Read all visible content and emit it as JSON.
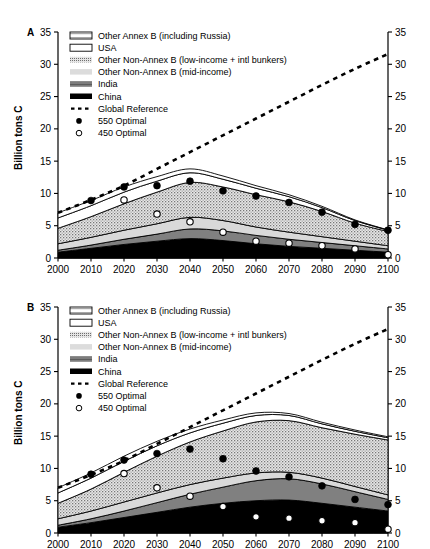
{
  "figure": {
    "panels": [
      {
        "letter": "A",
        "ylabel": "Billion tons C",
        "legend": [
          {
            "label": "Other Annex B (including Russia)",
            "swatch": "annexb-swatch"
          },
          {
            "label": "USA",
            "swatch": "usa-swatch"
          },
          {
            "label": "Other Non-Annex B (low-income + intl bunkers)",
            "swatch": "lowincome-swatch"
          },
          {
            "label": "Other Non-Annex B (mid-income)",
            "swatch": "midincome-swatch"
          },
          {
            "label": "India",
            "swatch": "india-swatch"
          },
          {
            "label": "China",
            "swatch": "china-swatch"
          },
          {
            "label": "Global Reference",
            "swatch": "dashed-line-swatch"
          },
          {
            "label": "550 Optimal",
            "swatch": "filled-circle-swatch"
          },
          {
            "label": "450 Optimal",
            "swatch": "open-circle-swatch"
          }
        ]
      },
      {
        "letter": "B",
        "ylabel": "Billion tons C",
        "legend": [
          {
            "label": "Other Annex B (including Russia)",
            "swatch": "annexb-swatch"
          },
          {
            "label": "USA",
            "swatch": "usa-swatch"
          },
          {
            "label": "Other Non-Annex B (low-income + intl bunkers)",
            "swatch": "lowincome-swatch"
          },
          {
            "label": "Other Non-Annex B (mid-income)",
            "swatch": "midincome-swatch"
          },
          {
            "label": "India",
            "swatch": "india-swatch"
          },
          {
            "label": "China",
            "swatch": "china-swatch"
          },
          {
            "label": "Global Reference",
            "swatch": "dashed-line-swatch"
          },
          {
            "label": "550 Optimal",
            "swatch": "filled-circle-swatch"
          },
          {
            "label": "450 Optimal",
            "swatch": "open-circle-swatch"
          }
        ]
      }
    ]
  },
  "colors": {
    "china": "#000000",
    "india": "#808080",
    "midincome": "#d9d9d9",
    "lowincome": "#b5b5b5",
    "usa": "#ffffff",
    "annexb": "#ffffff",
    "reference": "#000000",
    "axis": "#000000"
  },
  "chart_data": [
    {
      "type": "area",
      "title": "A",
      "panel": "A",
      "xlabel": "",
      "ylabel": "Billion tons C",
      "xlim": [
        2000,
        2100
      ],
      "ylim": [
        0,
        35
      ],
      "yticks": [
        0,
        5,
        10,
        15,
        20,
        25,
        30,
        35
      ],
      "grid": false,
      "legend_position": "top-left",
      "dual_y_axis": true,
      "x": [
        2000,
        2010,
        2020,
        2030,
        2040,
        2050,
        2060,
        2070,
        2080,
        2090,
        2100
      ],
      "categories": [
        "2000",
        "2010",
        "2020",
        "2030",
        "2040",
        "2050",
        "2060",
        "2070",
        "2080",
        "2090",
        "2100"
      ],
      "stack_order": [
        "China",
        "India",
        "Other Non-Annex B (mid-income)",
        "Other Non-Annex B (low-income + intl bunkers)",
        "USA",
        "Other Annex B (including Russia)"
      ],
      "series": [
        {
          "name": "China",
          "values": [
            0.9,
            1.5,
            2.1,
            2.6,
            3.0,
            2.7,
            2.2,
            1.8,
            1.5,
            1.2,
            0.9
          ]
        },
        {
          "name": "India",
          "values": [
            0.3,
            0.5,
            0.8,
            1.1,
            1.5,
            1.5,
            1.3,
            1.1,
            0.9,
            0.7,
            0.5
          ]
        },
        {
          "name": "Other Non-Annex B (mid-income)",
          "values": [
            1.0,
            1.2,
            1.4,
            1.6,
            1.8,
            1.6,
            1.3,
            1.1,
            0.9,
            0.7,
            0.5
          ]
        },
        {
          "name": "Other Non-Annex B (low-income + intl bunkers)",
          "values": [
            2.4,
            3.2,
            4.1,
            4.9,
            5.4,
            5.2,
            5.0,
            4.7,
            3.9,
            2.8,
            2.2
          ]
        },
        {
          "name": "USA",
          "values": [
            1.6,
            1.7,
            1.8,
            1.7,
            1.5,
            1.2,
            1.0,
            0.8,
            0.6,
            0.4,
            0.2
          ]
        },
        {
          "name": "Other Annex B (including Russia)",
          "values": [
            0.8,
            0.8,
            0.8,
            0.7,
            0.6,
            0.5,
            0.4,
            0.3,
            0.2,
            0.1,
            0.05
          ]
        }
      ],
      "stack_totals": [
        7.0,
        8.9,
        11.0,
        12.6,
        13.8,
        12.7,
        11.2,
        9.8,
        8.0,
        5.9,
        4.35
      ],
      "global_reference": {
        "name": "Global Reference",
        "style": "dashed",
        "x": [
          2000,
          2010,
          2020,
          2030,
          2040,
          2050,
          2060,
          2070,
          2080,
          2090,
          2100
        ],
        "values": [
          7.0,
          9.0,
          11.2,
          13.8,
          16.4,
          19.0,
          21.6,
          24.2,
          26.8,
          29.3,
          31.6
        ]
      },
      "optimal_550": {
        "name": "550 Optimal",
        "marker": "filled-circle",
        "x": [
          2010,
          2020,
          2030,
          2040,
          2050,
          2060,
          2070,
          2080,
          2090,
          2100
        ],
        "values": [
          8.9,
          11.0,
          11.2,
          11.9,
          10.4,
          9.6,
          8.6,
          7.1,
          5.2,
          4.3
        ]
      },
      "optimal_450": {
        "name": "450 Optimal",
        "marker": "open-circle",
        "x": [
          2020,
          2030,
          2040,
          2050,
          2060,
          2070,
          2080,
          2090,
          2100
        ],
        "values": [
          9.0,
          6.8,
          5.6,
          4.0,
          2.6,
          2.3,
          1.9,
          1.4,
          0.5
        ]
      }
    },
    {
      "type": "area",
      "title": "B",
      "panel": "B",
      "xlabel": "",
      "ylabel": "Billion tons C",
      "xlim": [
        2000,
        2100
      ],
      "ylim": [
        0,
        35
      ],
      "yticks": [
        0,
        5,
        10,
        15,
        20,
        25,
        30,
        35
      ],
      "grid": false,
      "legend_position": "top-left",
      "dual_y_axis": true,
      "x": [
        2000,
        2010,
        2020,
        2030,
        2040,
        2050,
        2060,
        2070,
        2080,
        2090,
        2100
      ],
      "categories": [
        "2000",
        "2010",
        "2020",
        "2030",
        "2040",
        "2050",
        "2060",
        "2070",
        "2080",
        "2090",
        "2100"
      ],
      "stack_order": [
        "China",
        "India",
        "Other Non-Annex B (mid-income)",
        "Other Non-Annex B (low-income + intl bunkers)",
        "USA",
        "Other Annex B (including Russia)"
      ],
      "series": [
        {
          "name": "China",
          "values": [
            0.9,
            1.6,
            2.4,
            3.2,
            4.0,
            4.6,
            5.0,
            5.1,
            4.6,
            4.0,
            3.4
          ]
        },
        {
          "name": "India",
          "values": [
            0.3,
            0.6,
            1.0,
            1.5,
            2.0,
            2.5,
            3.1,
            3.3,
            3.0,
            2.4,
            1.8
          ]
        },
        {
          "name": "Other Non-Annex B (mid-income)",
          "values": [
            1.0,
            1.2,
            1.4,
            1.5,
            1.5,
            1.4,
            1.2,
            1.0,
            0.9,
            0.8,
            0.7
          ]
        },
        {
          "name": "Other Non-Annex B (low-income + intl bunkers)",
          "values": [
            2.4,
            3.4,
            4.6,
            5.7,
            6.6,
            7.3,
            7.9,
            8.0,
            7.8,
            8.1,
            8.5
          ]
        },
        {
          "name": "USA",
          "values": [
            1.6,
            1.7,
            1.7,
            1.6,
            1.4,
            1.2,
            1.0,
            0.8,
            0.6,
            0.45,
            0.35
          ]
        },
        {
          "name": "Other Annex B (including Russia)",
          "values": [
            0.8,
            0.8,
            0.8,
            0.7,
            0.6,
            0.5,
            0.4,
            0.3,
            0.25,
            0.2,
            0.15
          ]
        }
      ],
      "stack_totals": [
        7.0,
        9.3,
        11.9,
        14.2,
        16.1,
        17.5,
        18.6,
        18.5,
        17.15,
        15.95,
        14.9
      ],
      "global_reference": {
        "name": "Global Reference",
        "style": "dashed",
        "x": [
          2000,
          2010,
          2020,
          2030,
          2040,
          2050,
          2060,
          2070,
          2080,
          2090,
          2100
        ],
        "values": [
          7.0,
          9.0,
          11.2,
          13.8,
          16.4,
          19.0,
          21.6,
          24.2,
          26.8,
          29.3,
          31.6
        ]
      },
      "optimal_550": {
        "name": "550 Optimal",
        "marker": "filled-circle",
        "x": [
          2010,
          2020,
          2030,
          2040,
          2050,
          2060,
          2070,
          2080,
          2090,
          2100
        ],
        "values": [
          9.1,
          11.3,
          12.3,
          13.0,
          11.5,
          9.6,
          8.7,
          7.3,
          5.2,
          4.4
        ]
      },
      "optimal_450": {
        "name": "450 Optimal",
        "marker": "open-circle",
        "x": [
          2020,
          2030,
          2040,
          2050,
          2060,
          2070,
          2080,
          2090,
          2100
        ],
        "values": [
          9.2,
          7.0,
          5.7,
          4.1,
          2.5,
          2.3,
          1.9,
          1.6,
          0.6
        ]
      }
    }
  ]
}
